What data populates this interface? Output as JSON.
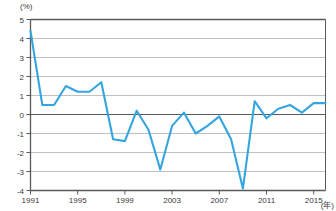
{
  "chart_data": {
    "type": "line",
    "title": "",
    "xlabel": "(年)",
    "ylabel": "(%)",
    "unit_y": "(%)",
    "unit_x": "(年)",
    "ylim": [
      -4,
      5
    ],
    "xlim": [
      1991,
      2016
    ],
    "grid": true,
    "legend": "none",
    "line_color": "#35a5e0",
    "zero_line": 0,
    "ytick_labels": [
      "5",
      "4",
      "3",
      "2",
      "1",
      "0",
      "-1",
      "-2",
      "-3",
      "-4"
    ],
    "ytick_values": [
      5,
      4,
      3,
      2,
      1,
      0,
      -1,
      -2,
      -3,
      -4
    ],
    "xtick_labels": [
      "1991",
      "1995",
      "1999",
      "2003",
      "2007",
      "2011",
      "2015"
    ],
    "xtick_values": [
      1991,
      1995,
      1999,
      2003,
      2007,
      2011,
      2015
    ],
    "x": [
      1991,
      1992,
      1993,
      1994,
      1995,
      1996,
      1997,
      1998,
      1999,
      2000,
      2001,
      2002,
      2003,
      2004,
      2005,
      2006,
      2007,
      2008,
      2009,
      2010,
      2011,
      2012,
      2013,
      2014,
      2015,
      2016
    ],
    "values": [
      4.4,
      0.5,
      0.5,
      1.5,
      1.2,
      1.2,
      1.7,
      -1.3,
      -1.4,
      0.2,
      -0.8,
      -2.9,
      -0.6,
      0.1,
      -1.0,
      -0.6,
      -0.1,
      -1.3,
      -3.9,
      0.7,
      -0.2,
      0.3,
      0.5,
      0.1,
      0.6,
      0.6
    ],
    "series": [
      {
        "name": "",
        "values": [
          4.4,
          0.5,
          0.5,
          1.5,
          1.2,
          1.2,
          1.7,
          -1.3,
          -1.4,
          0.2,
          -0.8,
          -2.9,
          -0.6,
          0.1,
          -1.0,
          -0.6,
          -0.1,
          -1.3,
          -3.9,
          0.7,
          -0.2,
          0.3,
          0.5,
          0.1,
          0.6,
          0.6
        ]
      }
    ]
  }
}
